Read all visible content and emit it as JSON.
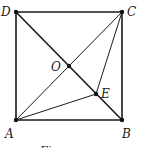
{
  "figure": {
    "type": "geometry",
    "shape": "square ABCD with diagonals AC and BD intersecting at O; point E on BD; segments AE and CE",
    "points": {
      "A": "A",
      "B": "B",
      "C": "C",
      "D": "D",
      "O": "O",
      "E": "E"
    },
    "segments": [
      {
        "from": "A",
        "to": "B",
        "style": "thick"
      },
      {
        "from": "B",
        "to": "C",
        "style": "thick"
      },
      {
        "from": "C",
        "to": "D",
        "style": "thick"
      },
      {
        "from": "D",
        "to": "A",
        "style": "thick"
      },
      {
        "from": "D",
        "to": "B",
        "style": "thick"
      },
      {
        "from": "A",
        "to": "C",
        "style": "thin"
      },
      {
        "from": "A",
        "to": "E",
        "style": "thin"
      },
      {
        "from": "C",
        "to": "E",
        "style": "thin"
      }
    ],
    "caption": "Figure"
  }
}
